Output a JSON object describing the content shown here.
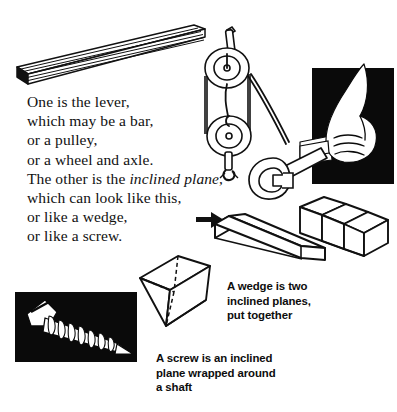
{
  "page": {
    "background_color": "#ffffff",
    "ink_color": "#111111"
  },
  "body_copy": {
    "lines": [
      "One is the lever,",
      "which may be a bar,",
      "or a pulley,",
      "or a wheel and axle."
    ],
    "line5_prefix": "The other is the ",
    "line5_italic": "inclined plane",
    "line5_suffix": ",",
    "line6": "which can look like this,",
    "line7": "or like a wedge,",
    "line8": "or like a screw."
  },
  "captions": {
    "wedge": {
      "lines": [
        "A wedge is two",
        "inclined planes,",
        "put together"
      ]
    },
    "screw": {
      "lines": [
        "A screw is an inclined",
        "plane wrapped around",
        "a shaft"
      ]
    }
  },
  "illustrations": [
    {
      "name": "lever-bar",
      "label": "long flat bar drawn in perspective"
    },
    {
      "name": "pulley-block",
      "label": "block and tackle pulley with rope and hook"
    },
    {
      "name": "hand-gripping-wrench",
      "label": "hand gripping a wrench on black panel"
    },
    {
      "name": "wrench",
      "label": "open-end wrench"
    },
    {
      "name": "ramp",
      "label": "inclined plane ramp"
    },
    {
      "name": "stairs",
      "label": "three step staircase"
    },
    {
      "name": "wedge-3d",
      "label": "three dimensional wedge with hidden edges"
    },
    {
      "name": "screw",
      "label": "white screw on black panel"
    },
    {
      "name": "pointer-arrow",
      "label": "bold arrow pointing right to the ramp"
    }
  ]
}
